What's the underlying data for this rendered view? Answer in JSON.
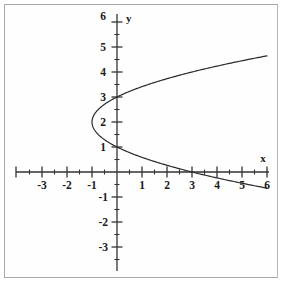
{
  "chart_data": {
    "type": "line",
    "title": "",
    "subtitle": "",
    "xlabel": "x",
    "ylabel": "y",
    "equation": "x = (y - 2)^2 - 1",
    "orientation": "horizontal-parabola-opens-right",
    "vertex": [
      -1,
      2
    ],
    "xlim": [
      -3.9,
      6.2
    ],
    "ylim": [
      -3.9,
      6.2
    ],
    "grid": false,
    "legend": null,
    "axis_color": "#333333",
    "curve_color": "#2b2b2b",
    "x_ticks_major": [
      -3,
      -2,
      -1,
      1,
      2,
      3,
      4,
      5,
      6
    ],
    "x_tick_labels": [
      "-3",
      "-2",
      "-1",
      "1",
      "2",
      "3",
      "4",
      "5",
      "6"
    ],
    "x_ticks_minor": [
      -3.5,
      -2.5,
      -1.5,
      -0.5,
      0.5,
      1.5,
      2.5,
      3.5,
      4.5,
      5.5
    ],
    "y_ticks_major": [
      -3,
      -2,
      -1,
      1,
      2,
      3,
      4,
      5,
      6
    ],
    "y_tick_labels": [
      "-3",
      "-2",
      "-1",
      "1",
      "2",
      "3",
      "4",
      "5",
      "6"
    ],
    "y_ticks_minor": [
      -3.5,
      -2.5,
      -1.5,
      -0.5,
      0.5,
      1.5,
      2.5,
      3.5,
      4.5,
      5.5
    ],
    "y_intercepts": [
      1,
      3
    ],
    "x_intercept": 3,
    "series": [
      {
        "name": "upper branch",
        "x": [
          -1,
          -0.9375,
          -0.75,
          -0.4375,
          0,
          0.5625,
          1.25,
          2.0625,
          3,
          4.0625,
          5.25,
          6
        ],
        "y": [
          2,
          2.25,
          2.5,
          2.75,
          3,
          3.25,
          3.5,
          3.75,
          4,
          4.25,
          4.5,
          4.646
        ]
      },
      {
        "name": "lower branch",
        "x": [
          -1,
          -0.9375,
          -0.75,
          -0.4375,
          0,
          0.5625,
          1.25,
          2.0625,
          3,
          4.0625,
          5.25,
          6
        ],
        "y": [
          2,
          1.75,
          1.5,
          1.25,
          1,
          0.75,
          0.5,
          0.25,
          0,
          -0.25,
          -0.5,
          -0.646
        ]
      }
    ]
  },
  "axes": {
    "x_axis_name": "x",
    "y_axis_name": "y"
  },
  "labels": {
    "x_axis": "x",
    "y_axis": "y",
    "y_6": "6",
    "y_5": "5",
    "y_4": "4",
    "y_3": "3",
    "y_2": "2",
    "y_1": "1",
    "y_m1": "-1",
    "y_m2": "-2",
    "y_m3": "-3",
    "x_m3": "-3",
    "x_m2": "-2",
    "x_m1": "-1",
    "x_1": "1",
    "x_2": "2",
    "x_3": "3",
    "x_4": "4",
    "x_5": "5",
    "x_6": "6"
  }
}
